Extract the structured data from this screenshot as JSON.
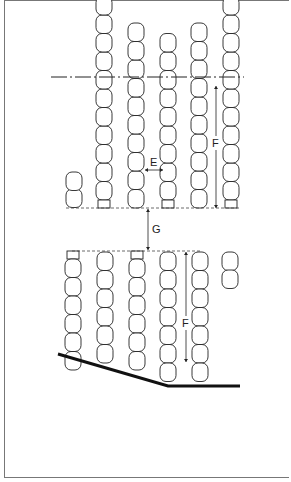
{
  "diagram": {
    "type": "seating-layout",
    "labels": {
      "E": "E",
      "F_upper": "F",
      "G": "G",
      "F_lower": "F"
    },
    "colors": {
      "line": "#222222",
      "border": "#777777",
      "background": "#ffffff"
    },
    "upper_block": {
      "columns": [
        {
          "x": 104,
          "top": 30,
          "seats": 11,
          "has_end_square": true
        },
        {
          "x": 136,
          "top": 40,
          "seats": 10,
          "has_end_square": false
        },
        {
          "x": 168,
          "top": 30,
          "seats": 9,
          "has_end_square": true,
          "partial_dashed": true
        },
        {
          "x": 199,
          "top": 40,
          "seats": 10,
          "has_end_square": false
        },
        {
          "x": 231,
          "top": 30,
          "seats": 11,
          "has_end_square": true
        }
      ],
      "partial_column": {
        "x": 74,
        "seats": 2
      }
    },
    "lower_block": {
      "columns": [
        {
          "x": 73,
          "top": 251,
          "seats": 6,
          "has_end_square": true
        },
        {
          "x": 105,
          "top": 251,
          "seats": 6,
          "has_end_square": false
        },
        {
          "x": 137,
          "top": 251,
          "seats": 6,
          "has_end_square": true
        },
        {
          "x": 168,
          "top": 251,
          "seats": 7,
          "has_end_square": false
        },
        {
          "x": 200,
          "top": 251,
          "seats": 7,
          "has_end_square": false
        }
      ],
      "partial_column": {
        "x": 230,
        "seats": 2
      }
    }
  }
}
